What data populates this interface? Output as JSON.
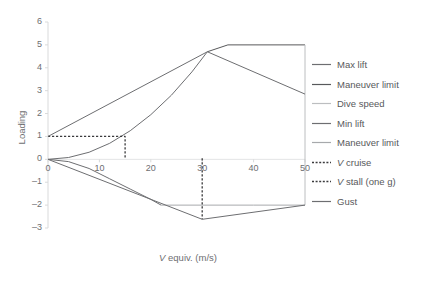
{
  "chart_data": {
    "type": "line",
    "title": "",
    "xlabel": "V equiv. (m/s)",
    "ylabel": "Loading",
    "xlim": [
      0,
      50
    ],
    "ylim": [
      -3,
      6
    ],
    "xticks": [
      0,
      10,
      20,
      30,
      40,
      50
    ],
    "yticks": [
      -3,
      -2,
      -1,
      0,
      1,
      2,
      3,
      4,
      5,
      6
    ],
    "grid": false,
    "legend_position": "right",
    "series": [
      {
        "name": "Max lift",
        "color": "#6d6e71",
        "style": "solid",
        "points": [
          [
            0,
            0
          ],
          [
            4,
            0.08
          ],
          [
            8,
            0.31
          ],
          [
            12,
            0.7
          ],
          [
            16,
            1.25
          ],
          [
            20,
            1.95
          ],
          [
            24,
            2.8
          ],
          [
            28,
            3.82
          ],
          [
            31,
            4.7
          ]
        ]
      },
      {
        "name": "Maneuver limit",
        "color": "#58595b",
        "style": "solid",
        "points": [
          [
            31,
            4.7
          ],
          [
            35,
            5.0
          ],
          [
            50,
            5.0
          ]
        ]
      },
      {
        "name": "Dive speed",
        "color": "#bcbec0",
        "style": "solid",
        "points": [
          [
            50,
            5.0
          ],
          [
            50,
            -2.0
          ]
        ]
      },
      {
        "name": "Min lift",
        "color": "#6d6e71",
        "style": "solid",
        "points": [
          [
            0,
            0
          ],
          [
            4,
            -0.1
          ],
          [
            8,
            -0.4
          ],
          [
            12,
            -0.85
          ],
          [
            16,
            -1.3
          ],
          [
            20,
            -1.75
          ],
          [
            22,
            -2.0
          ]
        ]
      },
      {
        "name": "Maneuver limit",
        "color": "#a7a9ac",
        "style": "solid",
        "points": [
          [
            22,
            -2.0
          ],
          [
            40,
            -2.0
          ],
          [
            50,
            -2.0
          ]
        ]
      },
      {
        "name": "V cruise",
        "color": "#3b3b3d",
        "style": "dashed",
        "points": [
          [
            30,
            0.05
          ],
          [
            30,
            -2.62
          ]
        ]
      },
      {
        "name": "V stall (one g)",
        "color": "#3b3b3d",
        "style": "dashed",
        "points": [
          [
            0,
            1.0
          ],
          [
            15,
            1.0
          ],
          [
            15,
            0.0
          ]
        ]
      },
      {
        "name": "Gust",
        "color": "#6d6e71",
        "style": "solid",
        "points": [
          [
            0,
            1.0
          ],
          [
            31,
            4.7
          ],
          [
            50,
            2.85
          ]
        ]
      },
      {
        "name": "Gust lower",
        "color": "#6d6e71",
        "style": "solid",
        "points": [
          [
            0,
            0.0
          ],
          [
            30,
            -2.62
          ],
          [
            50,
            -2.0
          ]
        ]
      }
    ]
  },
  "axis": {
    "ylabel": "Loading",
    "xlabel_prefix": "V",
    "xlabel_suffix": " equiv. (m/s)",
    "yticks": [
      "6",
      "5",
      "4",
      "3",
      "2",
      "1",
      "0",
      "-1",
      "-2",
      "-3"
    ],
    "xticks": [
      "0",
      "10",
      "20",
      "30",
      "40",
      "50"
    ]
  },
  "legend": {
    "items": [
      {
        "label": "Max lift",
        "color": "#6d6e71",
        "style": "solid",
        "italic_prefix": ""
      },
      {
        "label": "Maneuver limit",
        "color": "#58595b",
        "style": "solid",
        "italic_prefix": ""
      },
      {
        "label": "Dive speed",
        "color": "#bcbec0",
        "style": "solid",
        "italic_prefix": ""
      },
      {
        "label": "Min lift",
        "color": "#6d6e71",
        "style": "solid",
        "italic_prefix": ""
      },
      {
        "label": "Maneuver limit",
        "color": "#a7a9ac",
        "style": "solid",
        "italic_prefix": ""
      },
      {
        "label": " cruise",
        "color": "#3b3b3d",
        "style": "dashed",
        "italic_prefix": "V"
      },
      {
        "label": " stall (one g)",
        "color": "#3b3b3d",
        "style": "dashed",
        "italic_prefix": "V"
      },
      {
        "label": "Gust",
        "color": "#6d6e71",
        "style": "solid",
        "italic_prefix": ""
      }
    ]
  }
}
